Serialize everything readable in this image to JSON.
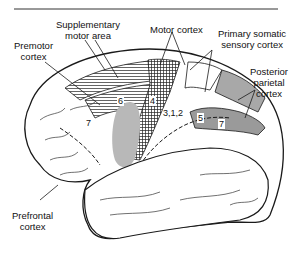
{
  "figure": {
    "labels": {
      "supplementary_motor_area": [
        "Supplementary",
        "motor area"
      ],
      "motor_cortex": "Motor cortex",
      "premotor_cortex": [
        "Premotor",
        "cortex"
      ],
      "primary_somatic_sensory_cortex": [
        "Primary somatic",
        "sensory cortex"
      ],
      "posterior_parietal_cortex": [
        "Posterior",
        "parietal",
        "cortex"
      ],
      "prefrontal_cortex": [
        "Prefrontal",
        "cortex"
      ]
    },
    "area_numbers": {
      "area_6": "6",
      "area_4": "4",
      "area_312": "3,1,2",
      "area_5": "5",
      "area_7a": "7",
      "area_7b": "7"
    },
    "colors": {
      "outline": "#1a1a1a",
      "gray_fill": "#b8b8b8",
      "dark_gray_fill": "#8c8c8c",
      "hatch": "#222222"
    }
  }
}
